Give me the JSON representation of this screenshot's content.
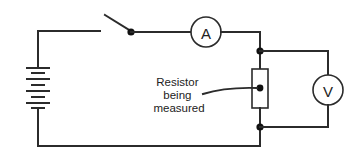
{
  "diagram": {
    "ammeter": {
      "symbol": "A"
    },
    "voltmeter": {
      "symbol": "V"
    },
    "resistor_label": {
      "lines": [
        "Resistor",
        "being",
        "measured"
      ]
    },
    "components": [
      "battery",
      "switch",
      "ammeter",
      "resistor",
      "voltmeter"
    ],
    "colors": {
      "line": "#2b2b2b",
      "background": "#ffffff",
      "text": "#222222"
    }
  }
}
